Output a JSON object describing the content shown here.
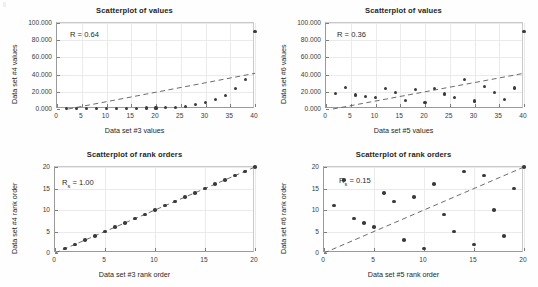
{
  "figure": {
    "width": 538,
    "height": 287,
    "background": "#ffffff",
    "marker_color": "#3b3b3b",
    "fitline_color": "#5a5a5a",
    "grid_color": "#eaeaea"
  },
  "chart_data": [
    {
      "id": "values-3-vs-4",
      "type": "scatter",
      "title": "Scatterplot of values",
      "xlabel": "Data set #3 values",
      "ylabel": "Data set #4 values",
      "annotation": "R = 0.64",
      "annotation_symbol": "R",
      "annotation_subscript": "",
      "annotation_value": "0.64",
      "xlim": [
        0,
        40
      ],
      "ylim": [
        0,
        100000
      ],
      "xticks": [
        0,
        5,
        10,
        15,
        20,
        25,
        30,
        35,
        40
      ],
      "xticklabels": [
        "0",
        "5",
        "10",
        "15",
        "20",
        "25",
        "30",
        "35",
        "40"
      ],
      "yticks": [
        0,
        20000,
        40000,
        60000,
        80000,
        100000
      ],
      "yticklabels": [
        "0.000",
        "20.000",
        "40.000",
        "60.000",
        "80.000",
        "100.000"
      ],
      "grid": true,
      "legend": "none",
      "x": [
        2,
        4,
        6,
        8,
        10,
        12,
        14,
        16,
        18,
        20,
        22,
        24,
        26,
        28,
        30,
        32,
        34,
        36,
        38,
        40
      ],
      "y": [
        300,
        400,
        500,
        600,
        700,
        800,
        900,
        1000,
        1100,
        1200,
        1400,
        1700,
        2800,
        4800,
        7600,
        11200,
        15800,
        23800,
        34000,
        90500
      ],
      "trendline": {
        "x0": 0,
        "y0": -2500,
        "x1": 40,
        "y1": 41500,
        "style": "dashed"
      }
    },
    {
      "id": "values-5-vs-6",
      "type": "scatter",
      "title": "Scatterplot of values",
      "xlabel": "Data set #5 values",
      "ylabel": "Data set #6 values",
      "annotation": "R = 0.36",
      "annotation_symbol": "R",
      "annotation_subscript": "",
      "annotation_value": "0.36",
      "xlim": [
        0,
        40
      ],
      "ylim": [
        0,
        100000
      ],
      "xticks": [
        0,
        5,
        10,
        15,
        20,
        25,
        30,
        35,
        40
      ],
      "xticklabels": [
        "0",
        "5",
        "10",
        "15",
        "20",
        "25",
        "30",
        "35",
        "40"
      ],
      "yticks": [
        0,
        20000,
        40000,
        60000,
        80000,
        100000
      ],
      "yticklabels": [
        "0.000",
        "20.000",
        "40.000",
        "60.000",
        "80.000",
        "100.000"
      ],
      "grid": true,
      "legend": "none",
      "x": [
        2,
        4,
        6,
        8,
        10,
        12,
        14,
        16,
        18,
        20,
        22,
        24,
        26,
        28,
        30,
        32,
        34,
        36,
        38,
        40
      ],
      "y": [
        17800,
        24800,
        16300,
        14400,
        13200,
        23600,
        19200,
        10200,
        22600,
        8000,
        24200,
        17400,
        13700,
        34600,
        9400,
        26300,
        18900,
        11400,
        24400,
        90500
      ],
      "trendline": {
        "x0": 0,
        "y0": -1500,
        "x1": 40,
        "y1": 41500,
        "style": "dashed"
      }
    },
    {
      "id": "ranks-3-vs-4",
      "type": "scatter",
      "title": "Scatterplot of rank orders",
      "xlabel": "Data set #3 rank order",
      "ylabel": "Data set #4 rank order",
      "annotation": "Rs = 1.00",
      "annotation_symbol": "R",
      "annotation_subscript": "s",
      "annotation_value": "1.00",
      "xlim": [
        0,
        20
      ],
      "ylim": [
        0,
        20
      ],
      "xticks": [
        0,
        5,
        10,
        15,
        20
      ],
      "xticklabels": [
        "0",
        "5",
        "10",
        "15",
        "20"
      ],
      "yticks": [
        0,
        5,
        10,
        15,
        20
      ],
      "yticklabels": [
        "0",
        "5",
        "10",
        "15",
        "20"
      ],
      "grid": true,
      "legend": "none",
      "x": [
        1,
        2,
        3,
        4,
        5,
        6,
        7,
        8,
        9,
        10,
        11,
        12,
        13,
        14,
        15,
        16,
        17,
        18,
        19,
        20
      ],
      "y": [
        1,
        2,
        3,
        4,
        5,
        6,
        7,
        8,
        9,
        10,
        11,
        12,
        13,
        14,
        15,
        16,
        17,
        18,
        19,
        20
      ],
      "trendline": {
        "x0": 0,
        "y0": 0,
        "x1": 20,
        "y1": 20,
        "style": "dashed"
      }
    },
    {
      "id": "ranks-5-vs-6",
      "type": "scatter",
      "title": "Scatterplot of rank orders",
      "xlabel": "Data set #5 rank order",
      "ylabel": "Data set #6 rank order",
      "annotation": "Rs = 0.15",
      "annotation_symbol": "R",
      "annotation_subscript": "s",
      "annotation_value": "0.15",
      "xlim": [
        0,
        20
      ],
      "ylim": [
        0,
        20
      ],
      "xticks": [
        0,
        5,
        10,
        15,
        20
      ],
      "xticklabels": [
        "0",
        "5",
        "10",
        "15",
        "20"
      ],
      "yticks": [
        0,
        5,
        10,
        15,
        20
      ],
      "yticklabels": [
        "0",
        "5",
        "10",
        "15",
        "20"
      ],
      "grid": true,
      "legend": "none",
      "x": [
        1,
        2,
        3,
        4,
        5,
        6,
        7,
        8,
        9,
        10,
        11,
        12,
        13,
        14,
        15,
        16,
        17,
        18,
        19,
        20
      ],
      "y": [
        11,
        17,
        8,
        7,
        6,
        14,
        12,
        3,
        13,
        1,
        16,
        9,
        5,
        19,
        2,
        18,
        10,
        4,
        15,
        20
      ],
      "trendline": {
        "x0": 0,
        "y0": 0,
        "x1": 20,
        "y1": 20,
        "style": "dashed"
      }
    }
  ]
}
